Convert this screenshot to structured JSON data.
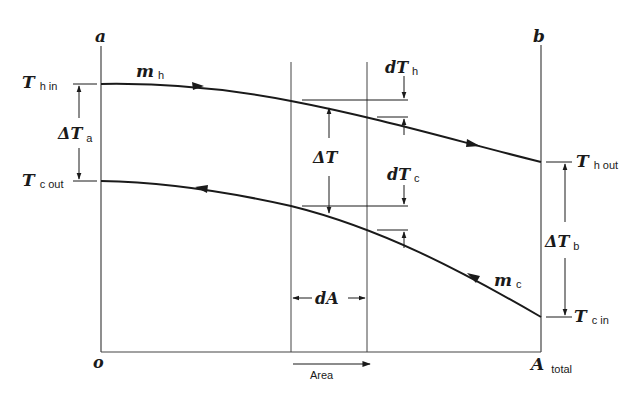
{
  "diagram": {
    "corner_labels": {
      "top_left": "a",
      "top_right": "b",
      "origin": "o",
      "end_main": "A",
      "end_sub": "total"
    },
    "axis": {
      "x_label": "Area"
    },
    "hot_stream": {
      "flow_main": "m",
      "flow_sub": "h",
      "inlet_main": "T",
      "inlet_sub": "h in",
      "outlet_main": "T",
      "outlet_sub": "h out"
    },
    "cold_stream": {
      "flow_main": "m",
      "flow_sub": "c",
      "inlet_main": "T",
      "inlet_sub": "c in",
      "outlet_main": "T",
      "outlet_sub": "c out"
    },
    "differences": {
      "delta_a_main": "ΔT",
      "delta_a_sub": "a",
      "delta_b_main": "ΔT",
      "delta_b_sub": "b",
      "delta_mid": "ΔT",
      "dT_hot_main": "dT",
      "dT_hot_sub": "h",
      "dT_cold_main": "dT",
      "dT_cold_sub": "c",
      "dA": "dA"
    },
    "colors": {
      "line": "#1a1a1a",
      "thin_line": "#444444",
      "background": "#ffffff"
    }
  }
}
